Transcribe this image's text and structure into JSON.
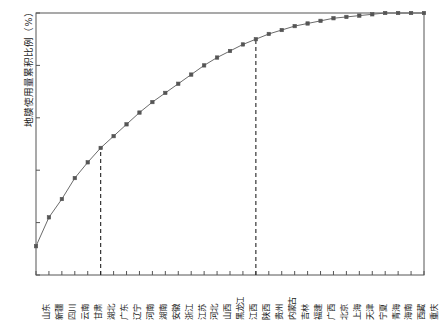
{
  "chart_data": {
    "type": "line",
    "title": "",
    "subtitle": "",
    "xlabel": "",
    "ylabel": "地膜使用量累积比例（%）",
    "ylim": [
      0,
      100
    ],
    "yticks": [
      0,
      20,
      40,
      60,
      80,
      100
    ],
    "grid": false,
    "legend": null,
    "marker": "square",
    "categories": [
      "山东",
      "新疆",
      "四川",
      "云南",
      "甘肃",
      "湖北",
      "广东",
      "辽宁",
      "河南",
      "湖南",
      "安徽",
      "浙江",
      "江苏",
      "河北",
      "山西",
      "黑龙江",
      "江西",
      "陕西",
      "贵州",
      "内蒙古",
      "吉林",
      "福建",
      "广西",
      "北京",
      "上海",
      "天津",
      "宁夏",
      "青海",
      "海南",
      "西藏",
      "重庆"
    ],
    "values": [
      11,
      22,
      29,
      37,
      43,
      48.5,
      53,
      57.5,
      62,
      66,
      69.5,
      73,
      76.5,
      80,
      83,
      85.5,
      88,
      90,
      92,
      93.5,
      95,
      96,
      97,
      98,
      98.5,
      99,
      99.5,
      100,
      100,
      100,
      100
    ],
    "series": [
      {
        "name": "地膜使用量累积比例",
        "values": [
          11,
          22,
          29,
          37,
          43,
          48.5,
          53,
          57.5,
          62,
          66,
          69.5,
          73,
          76.5,
          80,
          83,
          85.5,
          88,
          90,
          92,
          93.5,
          95,
          96,
          97,
          98,
          98.5,
          99,
          99.5,
          100,
          100,
          100,
          100
        ]
      }
    ],
    "annotations": [
      {
        "type": "vline",
        "category": "湖北",
        "index": 5,
        "value": 48.5,
        "style": "dashed"
      },
      {
        "type": "vline",
        "category": "陕西",
        "index": 17,
        "value": 90,
        "style": "dashed"
      }
    ],
    "colors": {
      "line": "#6b6b6b",
      "marker": "#555555",
      "axis": "#555555",
      "annotation": "#222222",
      "text": "#1b1b1b"
    }
  }
}
